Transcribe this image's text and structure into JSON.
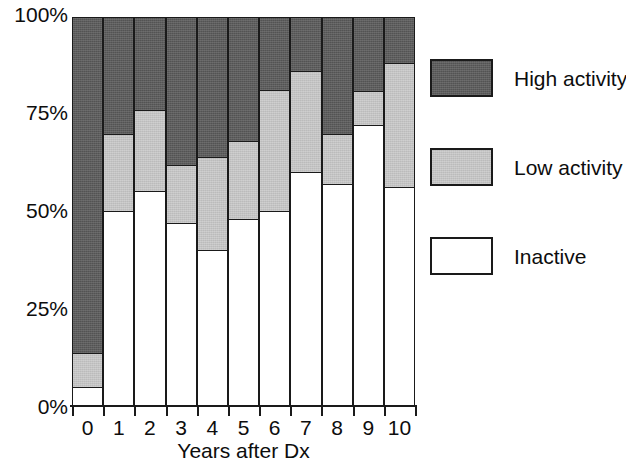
{
  "chart_data": {
    "type": "bar",
    "subtype": "stacked-percentage-column",
    "title": "",
    "xlabel": "Years after Dx",
    "ylabel": "",
    "categories": [
      "0",
      "1",
      "2",
      "3",
      "4",
      "5",
      "6",
      "7",
      "8",
      "9",
      "10"
    ],
    "ylim": [
      0,
      100
    ],
    "yticks": [
      0,
      25,
      50,
      75,
      100
    ],
    "ytick_labels": [
      "0%",
      "25%",
      "50%",
      "75%",
      "100%"
    ],
    "grid": false,
    "legend_position": "right",
    "stack_order_bottom_to_top": [
      "Inactive",
      "Low activity",
      "High activity"
    ],
    "series": [
      {
        "name": "Inactive",
        "color": "#ffffff",
        "values": [
          5,
          50,
          55,
          47,
          40,
          48,
          50,
          60,
          57,
          72,
          56
        ]
      },
      {
        "name": "Low activity",
        "color": "#c8c8c8",
        "values": [
          9,
          20,
          21,
          15,
          24,
          20,
          31,
          26,
          13,
          9,
          32
        ]
      },
      {
        "name": "High activity",
        "color": "#595959",
        "values": [
          86,
          30,
          24,
          38,
          36,
          32,
          19,
          14,
          30,
          19,
          12
        ]
      }
    ],
    "cumulative_tops": {
      "inactive": [
        5,
        50,
        55,
        47,
        40,
        48,
        50,
        60,
        57,
        72,
        56
      ],
      "low": [
        14,
        70,
        76,
        62,
        64,
        68,
        81,
        86,
        70,
        81,
        88
      ]
    }
  },
  "axis": {
    "y_tick_labels": [
      "100%",
      "75%",
      "50%",
      "25%",
      "0%"
    ],
    "x_tick_labels": [
      "0",
      "1",
      "2",
      "3",
      "4",
      "5",
      "6",
      "7",
      "8",
      "9",
      "10"
    ],
    "x_axis_title": "Years after Dx"
  },
  "legend": {
    "items": [
      {
        "label": "High activity",
        "key": "high"
      },
      {
        "label": "Low activity",
        "key": "low"
      },
      {
        "label": "Inactive",
        "key": "inactive"
      }
    ]
  },
  "colors": {
    "high_activity": "#595959",
    "low_activity": "#c8c8c8",
    "inactive": "#ffffff",
    "outline": "#1a1a1a",
    "text": "#0d0d0d",
    "background": "#ffffff"
  }
}
